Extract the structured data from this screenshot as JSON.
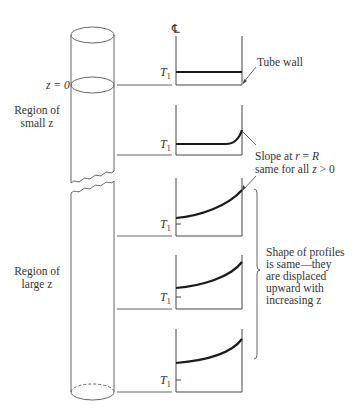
{
  "diagram": {
    "centerline_symbol": "℄",
    "labels": {
      "z0": "z = 0",
      "small_region_line1": "Region of",
      "small_region_line2": "small z",
      "large_region_line1": "Region of",
      "large_region_line2": "large z",
      "tube_wall": "Tube wall",
      "slope_line1": "Slope at r = R",
      "slope_line2": "same for all z > 0",
      "shape_line1": "Shape of profiles",
      "shape_line2": "is same—they",
      "shape_line3": "are displaced",
      "shape_line4": "upward with",
      "shape_line5": "increasing z"
    },
    "temperature_label": "T",
    "temperature_subscript": "1",
    "profiles": [
      {
        "name": "profile-z0",
        "shape": "flat"
      },
      {
        "name": "profile-small-z",
        "shape": "flat-then-sharp-rise-at-wall"
      },
      {
        "name": "profile-large-z-1",
        "shape": "curved-rising"
      },
      {
        "name": "profile-large-z-2",
        "shape": "curved-rising"
      },
      {
        "name": "profile-large-z-3",
        "shape": "curved-rising"
      }
    ]
  }
}
